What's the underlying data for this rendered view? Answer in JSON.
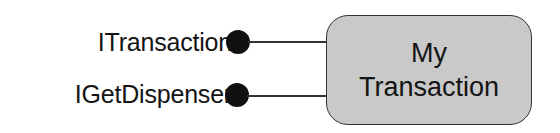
{
  "interfaces": [
    {
      "label": "ITransaction"
    },
    {
      "label": "IGetDispenser"
    }
  ],
  "component": {
    "title_line1": "My",
    "title_line2": "Transaction",
    "fill_color": "#c9c9c9"
  }
}
